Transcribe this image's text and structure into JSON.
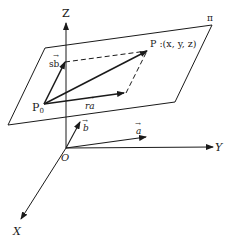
{
  "figure": {
    "type": "vector-plane-diagram",
    "colors": {
      "stroke": "#1a1a1a",
      "background": "#ffffff"
    }
  },
  "axes": {
    "x_label": "X",
    "y_label": "Y",
    "z_label": "Z",
    "origin_label": "O"
  },
  "plane": {
    "label": "π"
  },
  "points": {
    "p0_main": "P",
    "p0_sub": "0",
    "p_label": "P :(x, y, z)"
  },
  "vectors": {
    "sb_label": "sb",
    "ra_label": "ra",
    "a_label": "a",
    "b_label": "b",
    "arrow_mark": "→"
  }
}
